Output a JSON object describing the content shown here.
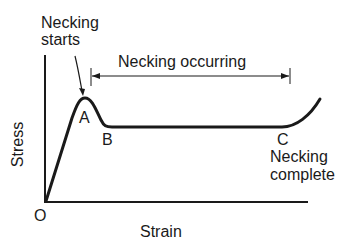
{
  "diagram": {
    "axes": {
      "x_label": "Strain",
      "y_label": "Stress",
      "origin_label": "O"
    },
    "points": {
      "A": "A",
      "B": "B",
      "C": "C"
    },
    "annotations": {
      "necking_starts_line1": "Necking",
      "necking_starts_line2": "starts",
      "necking_occurring": "Necking occurring",
      "necking_complete_line1": "Necking",
      "necking_complete_line2": "complete"
    },
    "colors": {
      "ink": "#1a1a1a",
      "background": "#ffffff"
    }
  }
}
